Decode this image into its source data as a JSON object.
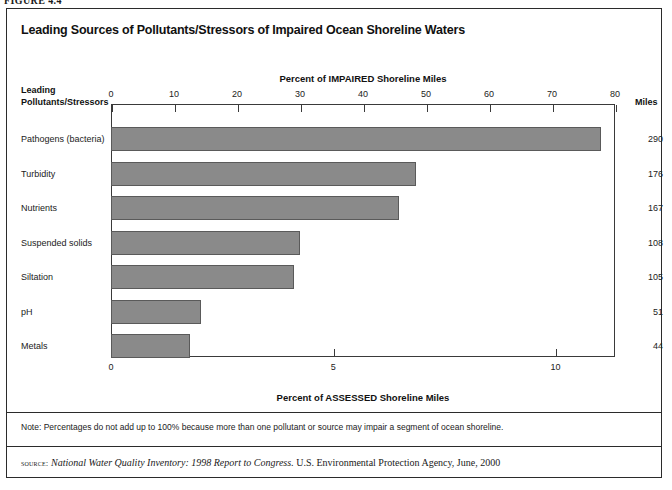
{
  "figure_caption": "FIGURE 4.4",
  "title": "Leading Sources of Pollutants/Stressors of Impaired Ocean Shoreline Waters",
  "corner_header_line1": "Leading",
  "corner_header_line2": "Pollutants/Stressors",
  "miles_header": "Miles",
  "note": "Note: Percentages do not add up to 100% because more than one pollutant or source may impair a segment of ocean shoreline.",
  "source": {
    "prefix": "source:",
    "italic": "National Water Quality Inventory: 1998 Report to Congress.",
    "rest": "U.S. Environmental Protection Agency, June, 2000"
  },
  "colors": {
    "bar_fill": "#8a8a8a",
    "bar_border": "#5a5a5a",
    "frame": "#2b2b2b",
    "axis": "#3a3a3a",
    "text": "#111111",
    "page_background": "#ffffff"
  },
  "chart_data": {
    "type": "bar",
    "orientation": "horizontal",
    "title": "Leading Sources of Pollutants/Stressors of Impaired Ocean Shoreline Waters",
    "xlabel": "Percent of IMPAIRED Shoreline Miles",
    "xlabel_secondary": "Percent of ASSESSED Shoreline Miles",
    "ylabel": "Leading Pollutants/Stressors",
    "grid": false,
    "legend": "none",
    "axis_top": {
      "label": "Percent of IMPAIRED Shoreline Miles",
      "range": [
        0,
        80
      ],
      "ticks": [
        0,
        10,
        20,
        30,
        40,
        50,
        60,
        70,
        80
      ],
      "tick_labels": [
        "0",
        "10",
        "20",
        "30",
        "40",
        "50",
        "60",
        "70",
        "80"
      ]
    },
    "axis_bottom": {
      "label": "Percent of ASSESSED Shoreline Miles",
      "range": [
        0,
        11.34
      ],
      "ticks": [
        0,
        5,
        10
      ],
      "tick_labels": [
        "0",
        "5",
        "10"
      ]
    },
    "categories": [
      "Pathogens (bacteria)",
      "Turbidity",
      "Nutrients",
      "Suspended solids",
      "Siltation",
      "pH",
      "Metals"
    ],
    "values": [
      77.8,
      48.4,
      45.7,
      30.0,
      29.0,
      14.3,
      12.5
    ],
    "miles": [
      290,
      176,
      167,
      108,
      105,
      51,
      44
    ],
    "rows": [
      {
        "label": "Pathogens (bacteria)",
        "percent": 77.8,
        "miles": "290"
      },
      {
        "label": "Turbidity",
        "percent": 48.4,
        "miles": "176"
      },
      {
        "label": "Nutrients",
        "percent": 45.7,
        "miles": "167"
      },
      {
        "label": "Suspended solids",
        "percent": 30.0,
        "miles": "108"
      },
      {
        "label": "Siltation",
        "percent": 29.0,
        "miles": "105"
      },
      {
        "label": "pH",
        "percent": 14.3,
        "miles": "51"
      },
      {
        "label": "Metals",
        "percent": 12.5,
        "miles": "44"
      }
    ]
  }
}
